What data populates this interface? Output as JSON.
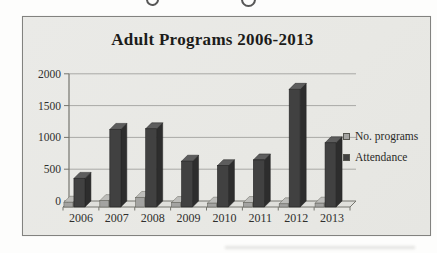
{
  "page": {
    "background_color": "#fdfdfc"
  },
  "chart": {
    "frame_background": "#e9e9e6",
    "frame_border_color": "#82827f"
  },
  "chart_data": {
    "type": "bar",
    "style": "3d-clustered-column",
    "title": "Adult Programs 2006-2013",
    "categories": [
      "2006",
      "2007",
      "2008",
      "2009",
      "2010",
      "2011",
      "2012",
      "2013"
    ],
    "series": [
      {
        "name": "No. programs",
        "values": [
          75,
          100,
          150,
          70,
          60,
          70,
          50,
          60
        ],
        "color": "#a3a3a1",
        "color_top": "#bdbdba",
        "color_side": "#7e7e7c",
        "outline": "#66665f"
      },
      {
        "name": "Attendance",
        "values": [
          450,
          1220,
          1230,
          720,
          650,
          740,
          1850,
          1010
        ],
        "color": "#414141",
        "color_top": "#5d5d5d",
        "color_side": "#2d2d2d",
        "outline": "#232323"
      }
    ],
    "xlabel": "",
    "ylabel": "",
    "ylim": [
      0,
      2000
    ],
    "yticks": [
      0,
      500,
      1000,
      1500,
      2000
    ],
    "grid": true,
    "gridline_color": "#a9a9a6",
    "axis_color": "#75756e",
    "floor_fill": "#dfdfdb",
    "tick_label_color": "#2f2f2d",
    "title_color": "#1c1c1a",
    "legend_position": "right",
    "legend_entries": [
      "No. programs",
      "Attendance"
    ]
  }
}
